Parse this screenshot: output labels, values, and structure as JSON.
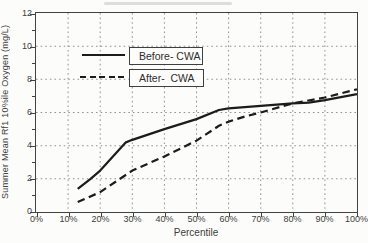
{
  "axes": {
    "xlabel": "Percentile",
    "ylabel": "Summer Mean Rf1 10%ile Oxygen (mg/L)"
  },
  "legend": {
    "items": [
      {
        "label": "Before- CWA",
        "style": "solid"
      },
      {
        "label": "After-  CWA",
        "style": "dashed"
      }
    ]
  },
  "chart_data": {
    "type": "line",
    "title": "",
    "xlabel": "Percentile",
    "ylabel": "Summer Mean Rf1 10%ile Oxygen (mg/L)",
    "xlim": [
      0,
      100
    ],
    "ylim": [
      0,
      12
    ],
    "x_tick_values": [
      0,
      10,
      20,
      30,
      40,
      50,
      60,
      70,
      80,
      90,
      100
    ],
    "x_tick_labels": [
      "0%",
      "10%",
      "20%",
      "30%",
      "40%",
      "50%",
      "60%",
      "70%",
      "80%",
      "90%",
      "100%"
    ],
    "y_tick_values": [
      0,
      2,
      4,
      6,
      8,
      10,
      12
    ],
    "y_minor_tick_values": [
      1,
      3,
      5,
      7,
      9,
      11
    ],
    "grid": {
      "style": "dotted",
      "x": [
        10,
        20,
        30,
        40,
        50,
        60,
        70,
        80,
        90
      ],
      "y": [
        2,
        4,
        6,
        8,
        10
      ],
      "color": "#939390"
    },
    "legend_position": "upper-left-inside",
    "line_color": "#1c1c1c",
    "series": [
      {
        "name": "Before- CWA",
        "line_style": "solid",
        "points": [
          [
            13,
            1.4
          ],
          [
            17,
            2.0
          ],
          [
            20,
            2.5
          ],
          [
            28,
            4.2
          ],
          [
            30,
            4.35
          ],
          [
            40,
            5.0
          ],
          [
            50,
            5.6
          ],
          [
            57,
            6.15
          ],
          [
            60,
            6.25
          ],
          [
            70,
            6.4
          ],
          [
            80,
            6.55
          ],
          [
            85,
            6.6
          ],
          [
            90,
            6.75
          ],
          [
            100,
            7.1
          ]
        ]
      },
      {
        "name": "After- CWA",
        "line_style": "dashed",
        "points": [
          [
            13,
            0.6
          ],
          [
            20,
            1.2
          ],
          [
            25,
            1.85
          ],
          [
            30,
            2.5
          ],
          [
            40,
            3.35
          ],
          [
            50,
            4.3
          ],
          [
            57,
            5.2
          ],
          [
            60,
            5.45
          ],
          [
            65,
            5.75
          ],
          [
            70,
            6.0
          ],
          [
            80,
            6.55
          ],
          [
            90,
            6.9
          ],
          [
            100,
            7.4
          ]
        ]
      }
    ]
  }
}
